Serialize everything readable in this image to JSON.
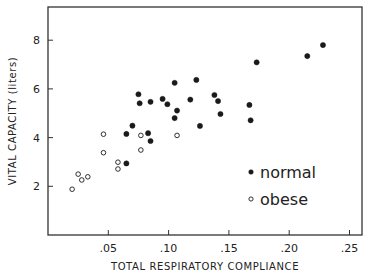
{
  "chart_data": {
    "type": "scatter",
    "title": "",
    "xlabel": "TOTAL RESPIRATORY COMPLIANCE",
    "ylabel": "VITAL CAPACITY (liters)",
    "xlim": [
      0,
      0.26
    ],
    "ylim": [
      0,
      9.4
    ],
    "xticks": [
      0.05,
      0.1,
      0.15,
      0.2,
      0.25
    ],
    "xtick_labels": [
      ".05",
      ".10",
      ".15",
      ".20",
      ".25"
    ],
    "yticks": [
      2,
      4,
      6,
      8
    ],
    "ytick_labels": [
      "2",
      "4",
      "6",
      "8"
    ],
    "grid": false,
    "legend_position": "inside-lower-right",
    "series": [
      {
        "name": "normal",
        "marker": "filled-circle",
        "points": [
          [
            0.065,
            2.94
          ],
          [
            0.065,
            4.15
          ],
          [
            0.07,
            4.49
          ],
          [
            0.083,
            4.18
          ],
          [
            0.085,
            3.86
          ],
          [
            0.075,
            5.78
          ],
          [
            0.076,
            5.41
          ],
          [
            0.085,
            5.47
          ],
          [
            0.095,
            5.59
          ],
          [
            0.099,
            5.37
          ],
          [
            0.107,
            5.11
          ],
          [
            0.105,
            4.8
          ],
          [
            0.105,
            6.25
          ],
          [
            0.123,
            6.37
          ],
          [
            0.118,
            5.56
          ],
          [
            0.138,
            5.75
          ],
          [
            0.141,
            5.5
          ],
          [
            0.143,
            4.97
          ],
          [
            0.126,
            4.48
          ],
          [
            0.167,
            5.34
          ],
          [
            0.168,
            4.71
          ],
          [
            0.173,
            7.09
          ],
          [
            0.215,
            7.35
          ],
          [
            0.228,
            7.8
          ]
        ]
      },
      {
        "name": "obese",
        "marker": "open-circle",
        "points": [
          [
            0.02,
            1.88
          ],
          [
            0.025,
            2.5
          ],
          [
            0.028,
            2.26
          ],
          [
            0.033,
            2.39
          ],
          [
            0.046,
            3.38
          ],
          [
            0.046,
            4.14
          ],
          [
            0.058,
            2.99
          ],
          [
            0.058,
            2.71
          ],
          [
            0.077,
            3.49
          ],
          [
            0.077,
            4.09
          ],
          [
            0.107,
            4.09
          ]
        ]
      }
    ]
  },
  "legend": {
    "items": [
      {
        "label": "normal",
        "marker": "filled-circle"
      },
      {
        "label": "obese",
        "marker": "open-circle"
      }
    ]
  },
  "colors": {
    "ink": "#1a1a1a",
    "frame": "#333333",
    "background": "#ffffff"
  }
}
